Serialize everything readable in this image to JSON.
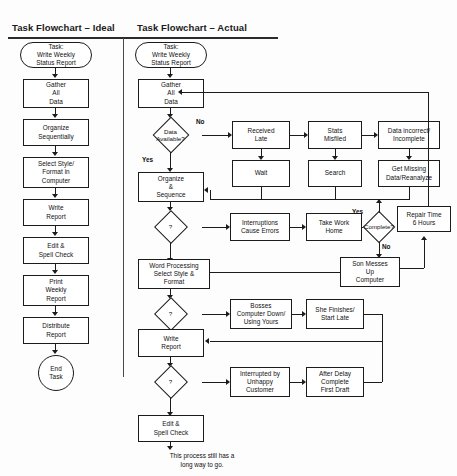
{
  "headers": {
    "ideal": "Task Flowchart – Ideal",
    "actual": "Task Flowchart – Actual"
  },
  "ideal_flow": {
    "start": "Task:\nWrite Weekly\nStatus Report",
    "steps": [
      "Gather\nAll\nData",
      "Organize\nSequentially",
      "Select Style/\nFormat in\nComputer",
      "Write\nReport",
      "Edit &\nSpell Check",
      "Print\nWeekly\nReport",
      "Distribute\nReport"
    ],
    "end": "End\nTask"
  },
  "actual_flow": {
    "start": "Task:\nWrite Weekly\nStatus Report",
    "gather": "Gather\nAll\nData",
    "decision_data_available": "Data\nAvailable?",
    "label_no_1": "No",
    "label_yes_1": "Yes",
    "received_late": "Received\nLate",
    "stats_misfiled": "Stats\nMisfiled",
    "data_incorrect": "Data incorrect/\nIncomplete",
    "wait": "Wait",
    "search": "Search",
    "get_missing": "Get Missing\nData/Reanalyze",
    "organize": "Organize\n&\nSequence",
    "decision_2": "?",
    "interruptions": "Interruptions\nCause Errors",
    "take_work_home": "Take Work\nHome",
    "decision_complete": "Complete?",
    "label_yes_2": "Yes",
    "label_no_2": "No",
    "repair_time": "Repair Time\n6 Hours",
    "son_messes": "Son Messes\nUp\nComputer",
    "word_processing": "Word Processing\nSelect Style &\nFormat",
    "decision_3": "?",
    "bosses_computer": "Bosses\nComputer Down/\nUsing Yours",
    "she_finishes": "She Finishes/\nStart Late",
    "write_report": "Write\nReport",
    "decision_4": "?",
    "interrupted_by": "Interrupted by\nUnhappy\nCustomer",
    "after_delay": "After Delay\nComplete\nFirst Draft",
    "edit_spell": "Edit &\nSpell Check",
    "footnote": "This process still has a\nlong way to go."
  },
  "colors": {
    "stroke": "#1b1b1b",
    "background": "#ffffff",
    "text": "#101010"
  }
}
